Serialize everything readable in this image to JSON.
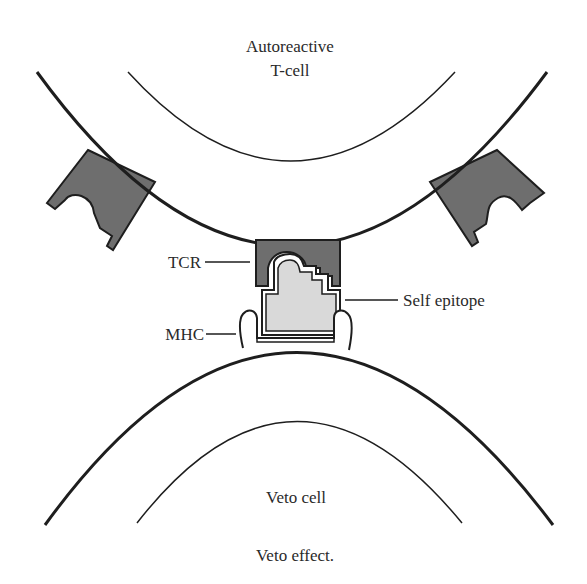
{
  "labels": {
    "top_cell_line1": "Autoreactive",
    "top_cell_line2": "T-cell",
    "tcr": "TCR",
    "self_epitope": "Self epitope",
    "mhc": "MHC",
    "bottom_cell": "Veto cell",
    "caption": "Veto effect."
  },
  "colors": {
    "receptor_fill": "#6e6e6e",
    "epitope_fill": "#d9d9d9",
    "outline": "#1e1e1e",
    "background": "#ffffff"
  }
}
